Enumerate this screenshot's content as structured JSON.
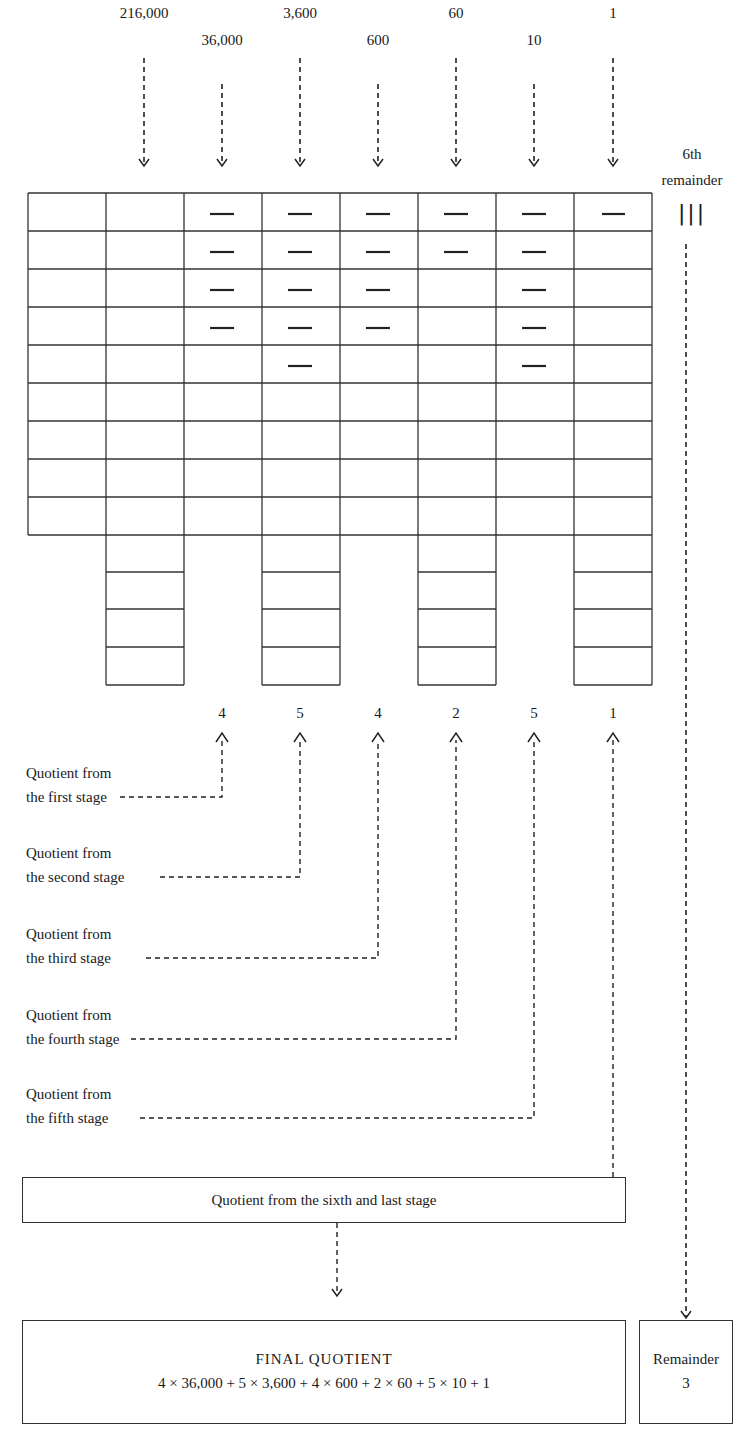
{
  "place_values": [
    {
      "label": "216,000",
      "col": 2,
      "row": "high"
    },
    {
      "label": "36,000",
      "col": 3,
      "row": "low"
    },
    {
      "label": "3,600",
      "col": 4,
      "row": "high"
    },
    {
      "label": "600",
      "col": 5,
      "row": "low"
    },
    {
      "label": "60",
      "col": 6,
      "row": "high"
    },
    {
      "label": "10",
      "col": 7,
      "row": "low"
    },
    {
      "label": "1",
      "col": 8,
      "row": "high"
    }
  ],
  "remainder_label": {
    "line1": "6th",
    "line2": "remainder",
    "tally": "|||"
  },
  "grid": {
    "columns": 8,
    "rows_main": 9,
    "hanging_columns": [
      2,
      4,
      6,
      8
    ],
    "hanging_rows": 4,
    "markers": {
      "col3": [
        1,
        2,
        3,
        4
      ],
      "col4": [
        1,
        2,
        3,
        4,
        5
      ],
      "col5": [
        1,
        2,
        3,
        4
      ],
      "col6": [
        1,
        2
      ],
      "col7": [
        1,
        2,
        3,
        4,
        5
      ],
      "col8": [
        1
      ]
    }
  },
  "quotient_digits": [
    "4",
    "5",
    "4",
    "2",
    "5",
    "1"
  ],
  "stage_labels": [
    {
      "line1": "Quotient from",
      "line2": "the first stage"
    },
    {
      "line1": "Quotient from",
      "line2": "the second stage"
    },
    {
      "line1": "Quotient from",
      "line2": "the third stage"
    },
    {
      "line1": "Quotient from",
      "line2": "the fourth stage"
    },
    {
      "line1": "Quotient from",
      "line2": "the fifth stage"
    }
  ],
  "sixth_stage_box": "Quotient from the sixth and last stage",
  "final_quotient": {
    "title": "FINAL QUOTIENT",
    "expression": "4 × 36,000 + 5 × 3,600 + 4 × 600 + 2 × 60 + 5 × 10 + 1"
  },
  "remainder_box": {
    "label": "Remainder",
    "value": "3"
  }
}
